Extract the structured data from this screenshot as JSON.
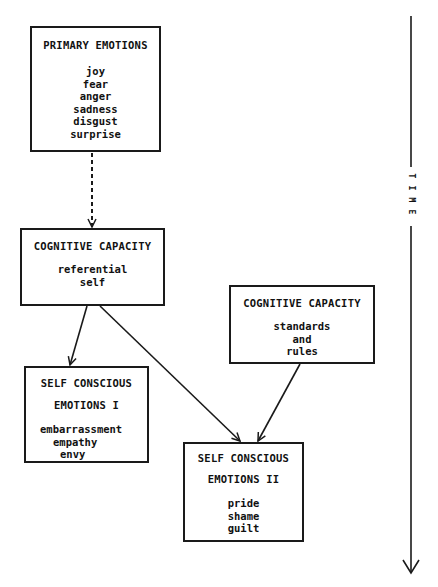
{
  "diagram": {
    "nodes": [
      {
        "id": "primary",
        "title": "PRIMARY EMOTIONS",
        "items": [
          "joy",
          "fear",
          "anger",
          "sadness",
          "disgust",
          "surprise"
        ]
      },
      {
        "id": "cog1",
        "title": "COGNITIVE CAPACITY",
        "items": [
          "referential",
          "self"
        ]
      },
      {
        "id": "cog2",
        "title": "COGNITIVE CAPACITY",
        "items": [
          "standards",
          "and",
          "rules"
        ]
      },
      {
        "id": "sc1",
        "title_line1": "SELF CONSCIOUS",
        "title_line2": "EMOTIONS I",
        "items": [
          "embarrassment",
          "empathy",
          "envy"
        ]
      },
      {
        "id": "sc2",
        "title_line1": "SELF CONSCIOUS",
        "title_line2": "EMOTIONS II",
        "items": [
          "pride",
          "shame",
          "guilt"
        ]
      }
    ],
    "edges": [
      {
        "from": "PRIMARY EMOTIONS",
        "to": "COGNITIVE CAPACITY (referential self)",
        "style": "dashed"
      },
      {
        "from": "COGNITIVE CAPACITY (referential self)",
        "to": "SELF CONSCIOUS EMOTIONS I",
        "style": "solid"
      },
      {
        "from": "COGNITIVE CAPACITY (referential self)",
        "to": "SELF CONSCIOUS EMOTIONS II",
        "style": "solid"
      },
      {
        "from": "COGNITIVE CAPACITY (standards and rules)",
        "to": "SELF CONSCIOUS EMOTIONS II",
        "style": "solid"
      }
    ],
    "time_axis": {
      "label": "TIME",
      "letters": [
        "T",
        "I",
        "M",
        "E"
      ],
      "direction": "down"
    },
    "colors": {
      "ink": "#1a1a1a",
      "background": "#ffffff"
    }
  }
}
